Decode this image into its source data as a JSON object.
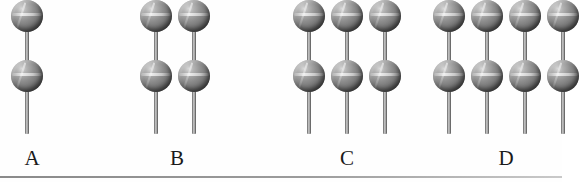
{
  "figure": {
    "background_color": "#fefefe",
    "ball_color": "#808080",
    "stick_color": "#9a9a9a",
    "baseline_color": "#8a8a8a",
    "caption_alt": "Four groups of pin-shaped objects; each object is a vertical stick carrying two spheres. Group A has 1 column, B has 2, C has 3, D has 4."
  },
  "groups": [
    {
      "id": "A",
      "label": "A",
      "columns": 1,
      "balls_per_column": 2,
      "total_balls": 2,
      "left": 8,
      "label_left": 12
    },
    {
      "id": "B",
      "label": "B",
      "columns": 2,
      "balls_per_column": 2,
      "total_balls": 4,
      "left": 137,
      "label_left": 157
    },
    {
      "id": "C",
      "label": "C",
      "columns": 3,
      "balls_per_column": 2,
      "total_balls": 6,
      "left": 290,
      "label_left": 327
    },
    {
      "id": "D",
      "label": "D",
      "columns": 4,
      "balls_per_column": 2,
      "total_balls": 8,
      "left": 430,
      "label_left": 486
    }
  ]
}
